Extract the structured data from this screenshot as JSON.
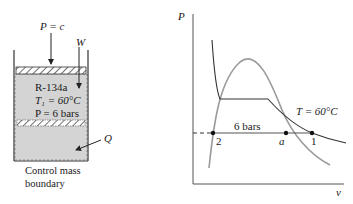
{
  "left_diagram": {
    "piston_pressure_label": "P = c",
    "work_label": "W",
    "heat_label": "Q",
    "substance": "R-134a",
    "temperature_state": "T₁ = 60°C",
    "pressure_state": "P = 6  bars",
    "boundary_label_line1": "Control mass",
    "boundary_label_line2": "boundary",
    "colors": {
      "fluid_fill": "#d4d4d4",
      "outline": "#333333"
    }
  },
  "pv_diagram": {
    "y_axis_label": "P",
    "x_axis_label": "v",
    "isobar_label": "6 bars",
    "isotherm_label": "T = 60°C",
    "points": [
      {
        "id": "2",
        "label": "2"
      },
      {
        "id": "a",
        "label": "a"
      },
      {
        "id": "1",
        "label": "1"
      }
    ],
    "colors": {
      "saturation_dome": "#9a9a9a",
      "isotherm": "#333333",
      "axes": "#555555"
    }
  }
}
